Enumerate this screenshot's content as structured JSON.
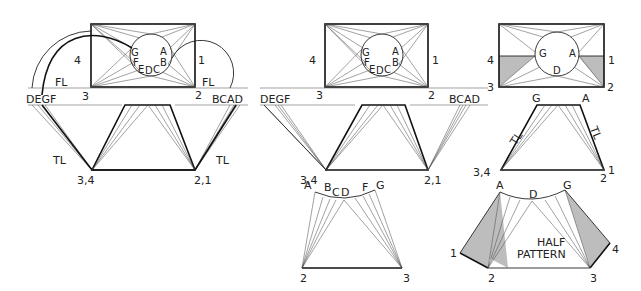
{
  "figure": {
    "panels": [
      {
        "id": "left",
        "plan_view": {
          "corner_labels": [
            "4",
            "3",
            "2",
            "1"
          ],
          "circle_labels": [
            "G",
            "A",
            "F",
            "E",
            "D",
            "C",
            "B"
          ]
        },
        "fold_line_labels": [
          "FL",
          "FL"
        ],
        "projection_labels": {
          "left": "DEGF",
          "right": "BCAD"
        },
        "true_length_labels": [
          "TL",
          "TL"
        ],
        "base_labels": [
          "3,4",
          "2,1"
        ],
        "plan_corner_labels": {
          "c3": "3",
          "c2": "2"
        }
      },
      {
        "id": "middle",
        "plan_view": {
          "corner_labels": [
            "4",
            "3",
            "2",
            "1"
          ],
          "circle_labels": [
            "G",
            "A",
            "F",
            "E",
            "D",
            "C",
            "B"
          ]
        },
        "projection_labels": {
          "left": "DEGF",
          "right": "BCAD"
        },
        "base_labels": [
          "3,4",
          "2,1"
        ],
        "development": {
          "arc_labels": [
            "A",
            "B",
            "C",
            "D",
            "F",
            "G"
          ],
          "base_labels": [
            "2",
            "3"
          ]
        }
      },
      {
        "id": "right",
        "plan_view": {
          "corner_labels": [
            "4",
            "3",
            "2",
            "1"
          ],
          "circle_labels": [
            "G",
            "A",
            "D"
          ]
        },
        "elevation": {
          "top_labels": [
            "G",
            "A"
          ],
          "true_length_labels": [
            "TL",
            "TL"
          ],
          "base_labels": [
            "3,4",
            "2",
            "1"
          ]
        },
        "development": {
          "arc_labels": [
            "A",
            "D",
            "G"
          ],
          "side_labels": [
            "1",
            "4"
          ],
          "base_labels": [
            "2",
            "3"
          ],
          "title_line1": "HALF",
          "title_line2": "PATTERN"
        }
      }
    ],
    "shade_color": "#bdbdbd",
    "line_color": "#222222"
  }
}
